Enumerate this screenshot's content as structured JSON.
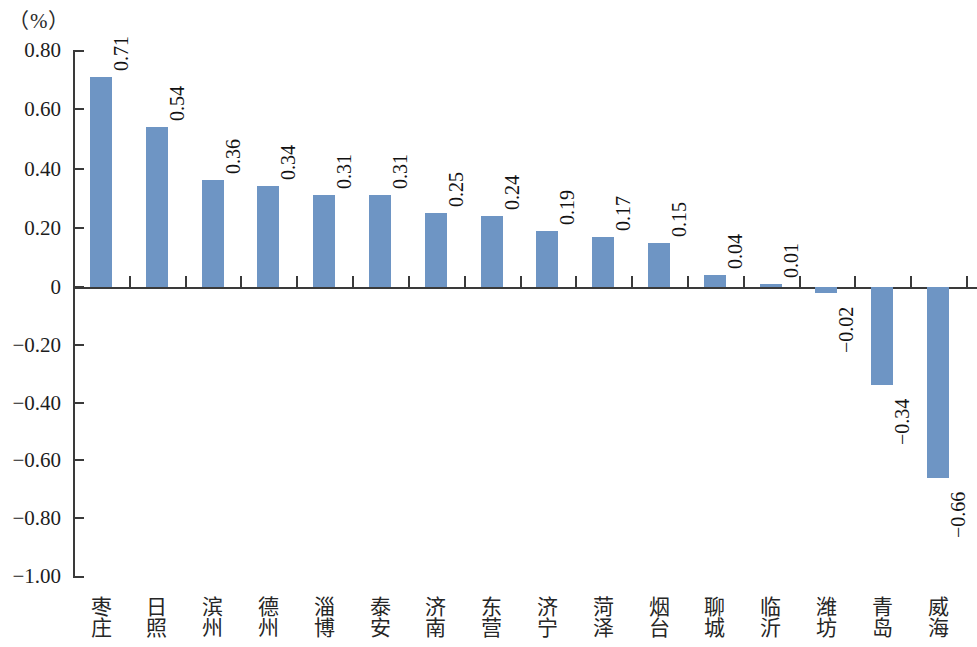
{
  "unit_label": "（%）",
  "axis": {
    "y_ticks": [
      "0.80",
      "0.60",
      "0.40",
      "0.20",
      "0",
      "−0.20",
      "−0.40",
      "−0.60",
      "−0.80",
      "−1.00"
    ],
    "y_max": 0.8,
    "y_min": -1.0
  },
  "colors": {
    "bar": "#6e95c4",
    "axis": "#3a3a3a",
    "text": "#1d1d1d",
    "background": "#ffffff"
  },
  "chart_data": {
    "type": "bar",
    "title": "",
    "subtitle": "",
    "xlabel": "",
    "ylabel": "（%）",
    "ylim": [
      -1.0,
      0.8
    ],
    "grid": false,
    "legend": null,
    "categories": [
      "枣庄",
      "日照",
      "滨州",
      "德州",
      "淄博",
      "泰安",
      "济南",
      "东营",
      "济宁",
      "菏泽",
      "烟台",
      "聊城",
      "临沂",
      "潍坊",
      "青岛",
      "威海"
    ],
    "values": [
      0.71,
      0.54,
      0.36,
      0.34,
      0.31,
      0.31,
      0.25,
      0.24,
      0.19,
      0.17,
      0.15,
      0.04,
      0.01,
      -0.02,
      -0.34,
      -0.66
    ],
    "value_labels": [
      "0.71",
      "0.54",
      "0.36",
      "0.34",
      "0.31",
      "0.31",
      "0.25",
      "0.24",
      "0.19",
      "0.17",
      "0.15",
      "0.04",
      "0.01",
      "−0.02",
      "−0.34",
      "−0.66"
    ],
    "tick_labels": [
      "0.80",
      "0.60",
      "0.40",
      "0.20",
      "0",
      "−0.20",
      "−0.40",
      "−0.60",
      "−0.80",
      "−1.00"
    ],
    "tick_values": [
      0.8,
      0.6,
      0.4,
      0.2,
      0,
      -0.2,
      -0.4,
      -0.6,
      -0.8,
      -1.0
    ]
  }
}
